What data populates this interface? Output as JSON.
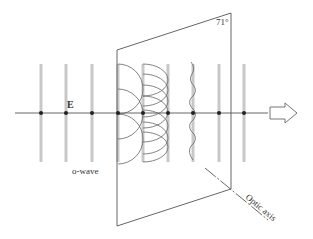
{
  "figure": {
    "labels": {
      "field": "E",
      "wave": "o-wave",
      "angle": "71°",
      "axis": "Optic axis"
    },
    "colors": {
      "line": "#555555",
      "bar": "#c8c8c8",
      "dot": "#222222",
      "text": "#333333"
    },
    "geometry": {
      "axis_y": 113,
      "bars_x": [
        41,
        66,
        92,
        118,
        143,
        168,
        193,
        219,
        244
      ],
      "bar_top": 64,
      "bar_bottom": 162,
      "plane": [
        [
          117,
          50
        ],
        [
          231,
          13
        ],
        [
          231,
          189
        ],
        [
          117,
          226
        ]
      ]
    }
  }
}
